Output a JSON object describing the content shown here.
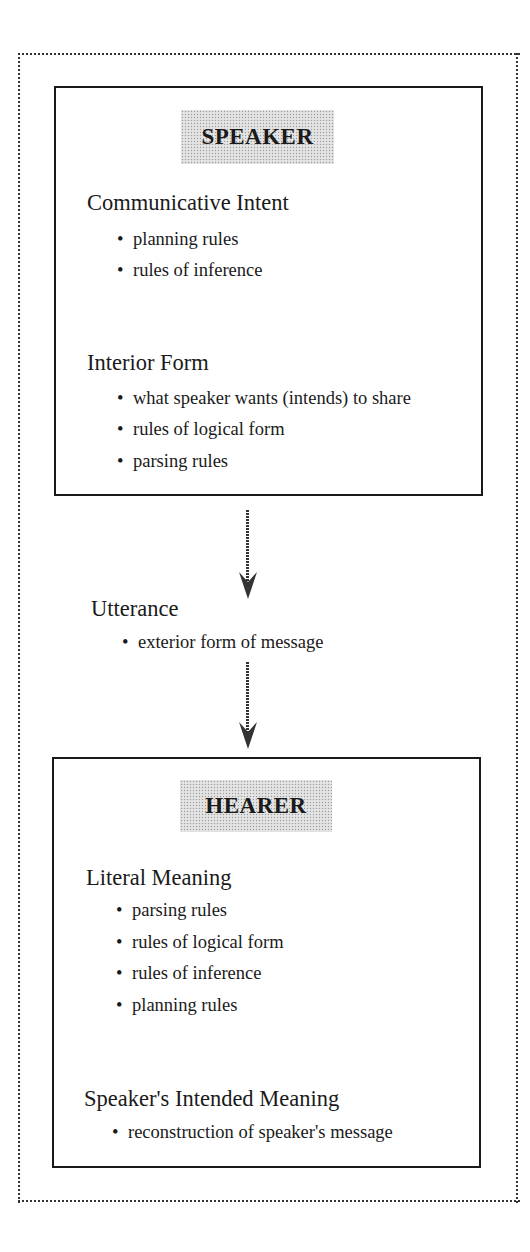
{
  "speaker": {
    "title": "SPEAKER",
    "sections": [
      {
        "heading": "Communicative Intent",
        "bullets": [
          "planning rules",
          "rules of inference"
        ]
      },
      {
        "heading": "Interior Form",
        "bullets": [
          "what speaker wants (intends) to share",
          "rules of logical form",
          "parsing rules"
        ]
      }
    ]
  },
  "utterance": {
    "heading": "Utterance",
    "bullets": [
      "exterior form of message"
    ]
  },
  "hearer": {
    "title": "HEARER",
    "sections": [
      {
        "heading": "Literal Meaning",
        "bullets": [
          "parsing rules",
          "rules of logical form",
          "rules of inference",
          "planning rules"
        ]
      },
      {
        "heading": "Speaker's Intended Meaning",
        "bullets": [
          "reconstruction of speaker's message"
        ]
      }
    ]
  },
  "bullet_glyph": "•",
  "colors": {
    "border": "#1a1a1a",
    "label_bg": "#e4e4e4",
    "text": "#1a1a1a"
  }
}
